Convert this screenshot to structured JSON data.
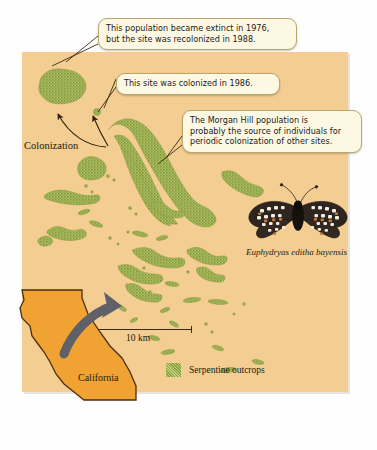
{
  "figure": {
    "type": "annotated-map"
  },
  "callouts": [
    {
      "id": "extinct-recolonized",
      "lines": [
        "This population became extinct in 1976,",
        "but the site was recolonized in 1988."
      ]
    },
    {
      "id": "colonized-1986",
      "lines": [
        "This site was colonized in 1986."
      ]
    },
    {
      "id": "morgan-hill-source",
      "lines": [
        "The Morgan Hill population is",
        "probably the source of individuals for",
        "periodic colonization of other sites."
      ]
    }
  ],
  "labels": {
    "colonization": "Colonization",
    "species": "Euphydryas editha bayensis",
    "california": "California"
  },
  "scale": {
    "distance": "10 km"
  },
  "legend": {
    "items": [
      {
        "label": "Serpentine outcrops",
        "color": "#9aae4e"
      }
    ]
  },
  "colors": {
    "map_background": "#f3cd91",
    "outcrop_green": "#9aae4e",
    "california_fill": "#f0a333",
    "arrow_gray": "#5f6068",
    "callout_fill": "#fdf8e3",
    "callout_border": "#b9a86a",
    "text": "#231a0f"
  }
}
